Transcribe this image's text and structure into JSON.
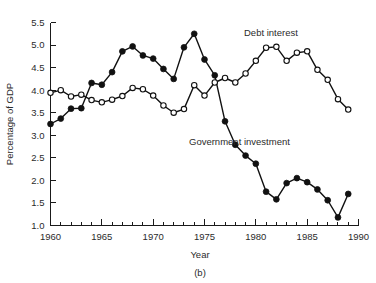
{
  "figure": {
    "caption": "(b)"
  },
  "chart_data": {
    "type": "line",
    "title": "",
    "xlabel": "Year",
    "ylabel": "Percentage of GDP",
    "xlim": [
      1960,
      1990
    ],
    "ylim": [
      1.0,
      5.5
    ],
    "xticks": [
      1960,
      1965,
      1970,
      1975,
      1980,
      1985,
      1990
    ],
    "xtick_labels": [
      "1960",
      "1965",
      "1970",
      "1975",
      "1980",
      "1985",
      "1990"
    ],
    "xminor_step": 1,
    "yticks": [
      1.0,
      1.5,
      2.0,
      2.5,
      3.0,
      3.5,
      4.0,
      4.5,
      5.0,
      5.5
    ],
    "ytick_labels": [
      "1.0",
      "1.5",
      "2.0",
      "2.5",
      "3.0",
      "3.5",
      "4.0",
      "4.5",
      "5.0",
      "5.5"
    ],
    "grid": false,
    "legend_position": "inline-annotations",
    "x": [
      1960,
      1961,
      1962,
      1963,
      1964,
      1965,
      1966,
      1967,
      1968,
      1969,
      1970,
      1971,
      1972,
      1973,
      1974,
      1975,
      1976,
      1977,
      1978,
      1979,
      1980,
      1981,
      1982,
      1983,
      1984,
      1985,
      1986,
      1987,
      1988,
      1989
    ],
    "series": [
      {
        "name": "Government investment",
        "marker": "filled-circle",
        "color": "#111111",
        "annotation": "Government investment",
        "values": [
          3.25,
          3.37,
          3.59,
          3.6,
          4.16,
          4.12,
          4.4,
          4.86,
          4.97,
          4.77,
          4.7,
          4.47,
          4.25,
          4.95,
          5.25,
          4.68,
          4.33,
          3.31,
          2.79,
          2.55,
          2.37,
          1.75,
          1.58,
          1.94,
          2.05,
          1.96,
          1.8,
          1.56,
          1.18,
          1.7
        ]
      },
      {
        "name": "Debt interest",
        "marker": "hollow-circle",
        "color": "#111111",
        "annotation": "Debt interest",
        "values": [
          3.94,
          4.0,
          3.86,
          3.9,
          3.78,
          3.73,
          3.79,
          3.87,
          4.05,
          4.02,
          3.88,
          3.66,
          3.5,
          3.58,
          4.11,
          3.88,
          4.17,
          4.27,
          4.17,
          4.37,
          4.65,
          4.94,
          4.96,
          4.65,
          4.83,
          4.86,
          4.45,
          4.23,
          3.8,
          3.57
        ]
      }
    ]
  }
}
